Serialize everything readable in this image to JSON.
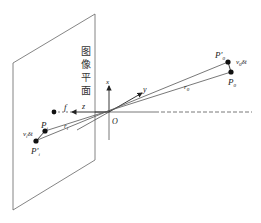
{
  "diagram": {
    "title": "",
    "plane_label": [
      "图",
      "像",
      "平",
      "面"
    ],
    "axes": {
      "x": "x",
      "y": "y",
      "z": "z",
      "origin": "O"
    },
    "focal_label": "f",
    "points": {
      "Pi": {
        "label": "P",
        "sub": "i"
      },
      "Pi_prime": {
        "label": "P'",
        "sub": "i"
      },
      "P0": {
        "label": "P",
        "sub": "0"
      },
      "P0_prime": {
        "label": "P'",
        "sub": "0"
      }
    },
    "vectors": {
      "ri": {
        "label": "r",
        "sub": "i"
      },
      "r0": {
        "label": "r",
        "sub": "0"
      },
      "vi_dt": {
        "v": "v",
        "sub": "i",
        "rest": "δt"
      },
      "v0_dt": {
        "v": "v",
        "sub": "0",
        "rest": "δt"
      }
    },
    "colors": {
      "line": "#555555",
      "text": "#222222",
      "point": "#111111"
    }
  }
}
